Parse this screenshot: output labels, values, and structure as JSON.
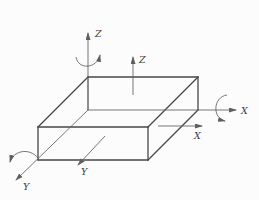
{
  "figure": {
    "width": 259,
    "height": 200,
    "background": "#fcfcfc",
    "edge_color": "#474747",
    "axis_color": "#5f5f5f",
    "label_color": "#3d3d3d",
    "edge_width": 1.3,
    "axis_width": 0.85
  },
  "box_edges": [
    {
      "name": "top-back-edge",
      "x1": 88,
      "y1": 77,
      "x2": 198,
      "y2": 77,
      "thin": false
    },
    {
      "name": "top-left-edge",
      "x1": 88,
      "y1": 77,
      "x2": 38,
      "y2": 127,
      "thin": false
    },
    {
      "name": "top-right-edge",
      "x1": 198,
      "y1": 77,
      "x2": 148,
      "y2": 127,
      "thin": false
    },
    {
      "name": "front-top-edge",
      "x1": 38,
      "y1": 127,
      "x2": 148,
      "y2": 127,
      "thin": false
    },
    {
      "name": "front-bottom-edge",
      "x1": 38,
      "y1": 160,
      "x2": 148,
      "y2": 160,
      "thin": false
    },
    {
      "name": "front-left-edge",
      "x1": 38,
      "y1": 127,
      "x2": 38,
      "y2": 160,
      "thin": false
    },
    {
      "name": "front-right-edge",
      "x1": 148,
      "y1": 127,
      "x2": 148,
      "y2": 160,
      "thin": false
    },
    {
      "name": "back-right-edge",
      "x1": 198,
      "y1": 77,
      "x2": 198,
      "y2": 110,
      "thin": false
    },
    {
      "name": "bottom-right-edge",
      "x1": 148,
      "y1": 160,
      "x2": 198,
      "y2": 110,
      "thin": false
    },
    {
      "name": "back-left-hidden-edge",
      "x1": 88,
      "y1": 77,
      "x2": 88,
      "y2": 110,
      "thin": true
    }
  ],
  "axes": [
    {
      "name": "main-z-axis",
      "label": "Z",
      "x1": 88,
      "y1": 110,
      "x2": 88,
      "y2": 33,
      "label_x": 95,
      "label_y": 37,
      "arc": "M 76,57 C 78,70 97,69 100,55"
    },
    {
      "name": "main-x-axis",
      "label": "X",
      "x1": 88,
      "y1": 110,
      "x2": 236,
      "y2": 110,
      "label_x": 241,
      "label_y": 114,
      "arc": "M 227,95 C 213,97 212,118 225,121"
    },
    {
      "name": "main-y-axis",
      "label": "Y",
      "x1": 88,
      "y1": 110,
      "x2": 16,
      "y2": 180,
      "label_x": 23,
      "label_y": 190,
      "arc": "M 38,158 C 29,147 13,151 10,162"
    },
    {
      "name": "local-z-axis",
      "label": "Z",
      "x1": 133,
      "y1": 95,
      "x2": 133,
      "y2": 57,
      "label_x": 139,
      "label_y": 63,
      "arc": null
    },
    {
      "name": "local-x-axis",
      "label": "X",
      "x1": 158,
      "y1": 126,
      "x2": 202,
      "y2": 126,
      "label_x": 194,
      "label_y": 139,
      "arc": null
    },
    {
      "name": "local-y-axis",
      "label": "Y",
      "x1": 105,
      "y1": 136,
      "x2": 78,
      "y2": 165,
      "label_x": 81,
      "label_y": 175,
      "arc": null
    }
  ]
}
